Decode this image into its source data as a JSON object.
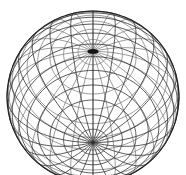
{
  "figure": {
    "background_color": "#ffffff",
    "line_color": "#3a3a3a",
    "front_line_color": "#2e2e2e",
    "back_line_color": "#6f6f6f",
    "outline_color": "#1d1d1d",
    "caption": ""
  },
  "geometry": {
    "center_x": 93,
    "center_y": 97,
    "radius": 86,
    "canvas_width": 186,
    "canvas_height": 175,
    "view_elevation_deg": 58,
    "view_azimuth_deg": 0,
    "north_pole_visible": "true",
    "south_pole_visible": "false",
    "bottom_clipped": "true"
  },
  "wireframe": {
    "meridian_count": 24,
    "parallel_count": 17,
    "meridian_step_deg": 15,
    "parallel_step_deg": 10,
    "latitudes_deg": [
      80,
      70,
      60,
      50,
      40,
      30,
      20,
      10,
      0,
      -10,
      -20,
      -30,
      -40,
      -50,
      -60,
      -70,
      -80
    ],
    "longitudes_deg": [
      0,
      15,
      30,
      45,
      60,
      75,
      90,
      105,
      120,
      135,
      150,
      165,
      180,
      195,
      210,
      225,
      240,
      255,
      270,
      285,
      300,
      315,
      330,
      345
    ],
    "pole_label": "north-pole-convergence"
  }
}
